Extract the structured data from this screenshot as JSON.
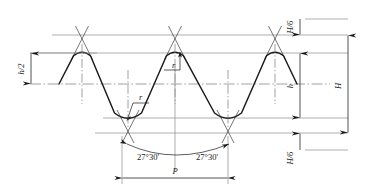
{
  "drawing": {
    "title": "Thread Profile Geometry",
    "type": "engineering-line-drawing",
    "background_color": "#ffffff",
    "profile_color": "#1a1a1a",
    "thin_line_color": "#8c8c8c",
    "center_line_color": "#7a7a7a",
    "labels": {
      "h_over_2": "h/2",
      "h": "h",
      "H": "H",
      "H_over_6_top": "H/6",
      "H_over_6_bottom": "H/6",
      "r_crest": "r",
      "r_root": "r",
      "angle_left": "27°30'",
      "angle_right": "27°30'",
      "pitch": "P"
    },
    "dimension_values": {
      "flank_half_angle_deg": 27.5,
      "full_thread_angle_deg": 55,
      "pitch_span_px": 106,
      "H_total_px": 98,
      "h_depth_px": 65,
      "H_over_6_px": 16.3
    },
    "geometry": {
      "top_line_y": 35,
      "crest_line_y": 53,
      "mid_line_y": 84,
      "root_line_y": 118,
      "bottom_line_y": 133,
      "crest_x_positions": [
        82,
        175,
        275
      ],
      "root_x_positions": [
        128,
        228
      ],
      "pitch_dim_left_x": 122,
      "pitch_dim_right_x": 228,
      "pitch_dim_y": 178,
      "right_dim_x": 300,
      "extension_line_right_x": 348
    }
  }
}
